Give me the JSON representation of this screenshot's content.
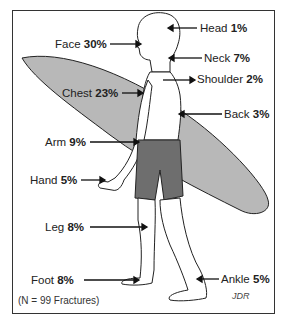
{
  "figure": {
    "type": "body-diagram",
    "note": "(N = 99 Fractures)",
    "signature": "JDR",
    "colors": {
      "board": "#b8b8b8",
      "shorts": "#6e6e6e",
      "outline": "#222222",
      "frame": "#333333"
    }
  },
  "labels": [
    {
      "name": "Head",
      "value": "1%"
    },
    {
      "name": "Face",
      "value": "30%"
    },
    {
      "name": "Neck",
      "value": "7%"
    },
    {
      "name": "Shoulder",
      "value": "2%"
    },
    {
      "name": "Chest",
      "value": "23%"
    },
    {
      "name": "Back",
      "value": "3%"
    },
    {
      "name": "Arm",
      "value": "9%"
    },
    {
      "name": "Hand",
      "value": "5%"
    },
    {
      "name": "Leg",
      "value": "8%"
    },
    {
      "name": "Foot",
      "value": "8%"
    },
    {
      "name": "Ankle",
      "value": "5%"
    }
  ]
}
